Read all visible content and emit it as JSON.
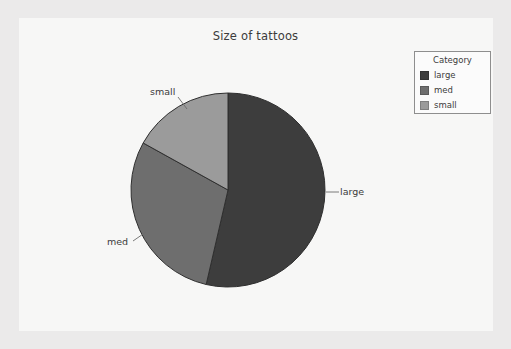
{
  "chart_data": {
    "type": "pie",
    "title": "Size of tattoos",
    "xlabel": "",
    "ylabel": "",
    "legend_title": "Category",
    "legend_position": "top-right",
    "grid": false,
    "start_angle_deg": 0,
    "direction": "clockwise",
    "categories": [
      "large",
      "med",
      "small"
    ],
    "values": [
      53.6,
      29.4,
      17.0
    ],
    "value_unit": "percent",
    "colors": [
      "#3d3d3d",
      "#6e6e6e",
      "#9b9b9b"
    ],
    "slices": [
      {
        "label": "large",
        "value": 53.6,
        "color": "#3d3d3d",
        "start_deg": 0,
        "end_deg": 193
      },
      {
        "label": "med",
        "value": 29.4,
        "color": "#6e6e6e",
        "start_deg": 193,
        "end_deg": 299
      },
      {
        "label": "small",
        "value": 17.0,
        "color": "#9b9b9b",
        "start_deg": 299,
        "end_deg": 360
      }
    ],
    "annotations": [
      {
        "text": "small",
        "target": "small"
      },
      {
        "text": "med",
        "target": "med"
      },
      {
        "text": "large",
        "target": "large"
      }
    ]
  },
  "panel": {
    "background": "#f7f7f6",
    "outer_background": "#ebeaea"
  },
  "title": {
    "text": "Size of tattoos",
    "color": "#3b3b3b"
  },
  "labels": {
    "small": "small",
    "med": "med",
    "large": "large"
  },
  "legend": {
    "title": "Category",
    "items": [
      {
        "label": "large",
        "color": "#3d3d3d"
      },
      {
        "label": "med",
        "color": "#6e6e6e"
      },
      {
        "label": "small",
        "color": "#9b9b9b"
      }
    ]
  }
}
